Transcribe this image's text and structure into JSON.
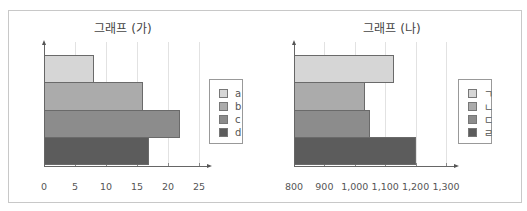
{
  "chart_data": [
    {
      "type": "bar",
      "orientation": "horizontal",
      "title": "그래프 (가)",
      "categories": [
        "a",
        "b",
        "c",
        "d"
      ],
      "values": [
        8,
        16,
        22,
        17
      ],
      "xlabel": "",
      "ylabel": "",
      "xlim": [
        0,
        25
      ],
      "xticks": [
        "0",
        "5",
        "10",
        "15",
        "20",
        "25"
      ],
      "grid": "vertical",
      "legend": {
        "position": "right",
        "entries": [
          "a",
          "b",
          "c",
          "d"
        ]
      },
      "colors": [
        "#d6d6d6",
        "#ababab",
        "#8c8c8c",
        "#5c5c5c"
      ]
    },
    {
      "type": "bar",
      "orientation": "horizontal",
      "title": "그래프 (나)",
      "categories": [
        "ㄱ",
        "ㄴ",
        "ㄷ",
        "ㄹ"
      ],
      "values": [
        1130,
        1035,
        1050,
        1200
      ],
      "xlabel": "",
      "ylabel": "",
      "xlim": [
        800,
        1300
      ],
      "xticks": [
        "800",
        "900",
        "1,000",
        "1,100",
        "1,200",
        "1,300"
      ],
      "grid": "vertical",
      "legend": {
        "position": "right",
        "entries": [
          "ㄱ",
          "ㄴ",
          "ㄷ",
          "ㄹ"
        ]
      },
      "colors": [
        "#d6d6d6",
        "#ababab",
        "#8c8c8c",
        "#5c5c5c"
      ]
    }
  ]
}
